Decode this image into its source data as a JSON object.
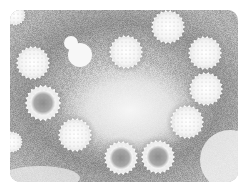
{
  "image": {
    "subject": "electron micrograph of spherical virus particles",
    "description": "Grayscale negative-stain micrograph showing a ring of spiky spherical virus particles on a gray speckled background with a lighter center",
    "colors": {
      "page_background": "#ffffff",
      "stain_dark": "#8a8a8a",
      "stain_mid": "#b5b5b5",
      "center_light": "#f2f2f2",
      "particle": "#fafafa",
      "particle_core_dark": "#8c8c8c"
    },
    "particles": [
      {
        "cx": 15,
        "cy": 15,
        "r": 10,
        "core": false
      },
      {
        "cx": 33,
        "cy": 63,
        "r": 16,
        "core": false
      },
      {
        "cx": 43,
        "cy": 103,
        "r": 17,
        "core": true
      },
      {
        "cx": 12,
        "cy": 142,
        "r": 10,
        "core": false
      },
      {
        "cx": 75,
        "cy": 135,
        "r": 16,
        "core": false
      },
      {
        "cx": 126,
        "cy": 52,
        "r": 16,
        "core": false
      },
      {
        "cx": 168,
        "cy": 27,
        "r": 16,
        "core": false
      },
      {
        "cx": 205,
        "cy": 53,
        "r": 16,
        "core": false
      },
      {
        "cx": 206,
        "cy": 89,
        "r": 16,
        "core": false
      },
      {
        "cx": 187,
        "cy": 122,
        "r": 16,
        "core": false
      },
      {
        "cx": 121,
        "cy": 158,
        "r": 16,
        "core": true
      },
      {
        "cx": 158,
        "cy": 157,
        "r": 16,
        "core": true
      }
    ],
    "blobs": [
      {
        "cx": 80,
        "cy": 55,
        "r": 12
      },
      {
        "cx": 71,
        "cy": 43,
        "r": 7
      }
    ]
  }
}
